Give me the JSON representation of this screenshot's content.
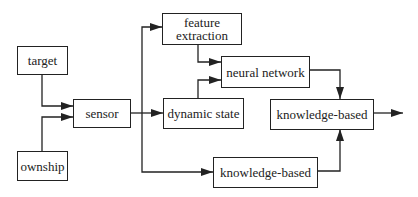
{
  "diagram": {
    "type": "flow-block-diagram",
    "nodes": [
      {
        "id": "target",
        "label": "target"
      },
      {
        "id": "ownship",
        "label": "ownship"
      },
      {
        "id": "sensor",
        "label": "sensor"
      },
      {
        "id": "feature_extraction",
        "label_line1": "feature",
        "label_line2": "extraction"
      },
      {
        "id": "dynamic_state",
        "label": "dynamic state"
      },
      {
        "id": "neural_network",
        "label": "neural network"
      },
      {
        "id": "knowledge_based_main",
        "label": "knowledge-based"
      },
      {
        "id": "knowledge_based_lower",
        "label": "knowledge-based"
      }
    ],
    "edges": [
      {
        "from": "target",
        "to": "sensor"
      },
      {
        "from": "ownship",
        "to": "sensor"
      },
      {
        "from": "sensor",
        "to": "feature_extraction"
      },
      {
        "from": "sensor",
        "to": "dynamic_state"
      },
      {
        "from": "sensor",
        "to": "knowledge_based_lower"
      },
      {
        "from": "feature_extraction",
        "to": "neural_network"
      },
      {
        "from": "dynamic_state",
        "to": "neural_network"
      },
      {
        "from": "neural_network",
        "to": "knowledge_based_main"
      },
      {
        "from": "knowledge_based_lower",
        "to": "knowledge_based_main"
      },
      {
        "from": "knowledge_based_main",
        "to": "output"
      }
    ],
    "colors": {
      "stroke": "#222222",
      "background": "#ffffff"
    }
  }
}
